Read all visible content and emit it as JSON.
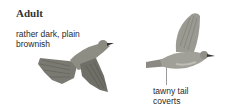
{
  "heading": "Adult",
  "annotations": [
    {
      "lines": [
        "rather dark, plain",
        "brownish"
      ]
    },
    {
      "lines": [
        "tawny tail",
        "coverts"
      ]
    }
  ],
  "illustrations": [
    {
      "name": "bird-perched-flying-left",
      "pose": "flying, wings down, head right"
    },
    {
      "name": "bird-flying-right",
      "pose": "flying, wing raised, head right"
    }
  ],
  "colors": {
    "bird_body": "#8a8a80",
    "bird_wing": "#6f6f68",
    "leader_line": "#9a9a9a",
    "text": "#2a2a2a"
  }
}
